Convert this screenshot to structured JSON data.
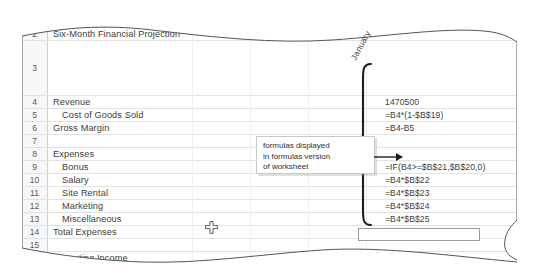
{
  "document": {
    "type": "spreadsheet-excerpt",
    "title_row1": "Manola Department",
    "title_row2": "Six-Month Financial Projection",
    "column_header_rotated": "January"
  },
  "grid": {
    "row_header_column_label": "row-numbers",
    "selected_row": "17",
    "rows": [
      {
        "num": "1",
        "label": "Manola Department",
        "indent": false,
        "formula": ""
      },
      {
        "num": "2",
        "label": "Six-Month Financial Projection",
        "indent": false,
        "formula": ""
      },
      {
        "num": "3",
        "label": "",
        "indent": false,
        "formula": ""
      },
      {
        "num": "4",
        "label": "Revenue",
        "indent": false,
        "formula": "1470500"
      },
      {
        "num": "5",
        "label": "Cost of Goods Sold",
        "indent": true,
        "formula": "=B4*(1-$B$19)"
      },
      {
        "num": "6",
        "label": "Gross Margin",
        "indent": false,
        "formula": "=B4-B5"
      },
      {
        "num": "7",
        "label": "",
        "indent": false,
        "formula": ""
      },
      {
        "num": "8",
        "label": "Expenses",
        "indent": false,
        "formula": ""
      },
      {
        "num": "9",
        "label": "Bonus",
        "indent": true,
        "formula": "=IF(B4>=$B$21,$B$20,0)"
      },
      {
        "num": "10",
        "label": "Salary",
        "indent": true,
        "formula": "=B4*$B$22"
      },
      {
        "num": "11",
        "label": "Site Rental",
        "indent": true,
        "formula": "=B4*$B$23"
      },
      {
        "num": "12",
        "label": "Marketing",
        "indent": true,
        "formula": "=B4*$B$24"
      },
      {
        "num": "13",
        "label": "Miscellaneous",
        "indent": true,
        "formula": "=B4*$B$25"
      },
      {
        "num": "14",
        "label": "Total Expenses",
        "indent": false,
        "formula": "=SUM(B9:B13)"
      },
      {
        "num": "15",
        "label": "",
        "indent": false,
        "formula": ""
      },
      {
        "num": "16",
        "label": "Operating Income",
        "indent": false,
        "formula": "=B6-B14"
      },
      {
        "num": "17",
        "label": "",
        "indent": false,
        "formula": ""
      },
      {
        "num": "18",
        "label": "What-If Assumptions",
        "indent": false,
        "formula": ""
      }
    ]
  },
  "callout": {
    "line1": "formulas displayed",
    "line2": "in formulas version",
    "line3": "of worksheet"
  },
  "icons": {
    "cursor": "move-plus-cursor",
    "brace": "curly-brace-grouping",
    "arrow": "callout-arrow"
  },
  "colors": {
    "paper": "#ffffff",
    "row_header_bg": "#f7f7f7",
    "row_header_selected_bg": "#cfcfcf",
    "gridline": "#e2e2e2",
    "text": "#3d3d3d",
    "edge_line": "#555555"
  }
}
